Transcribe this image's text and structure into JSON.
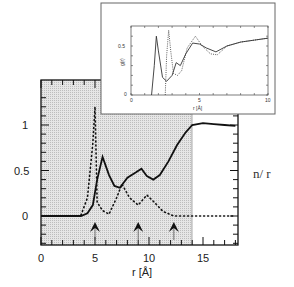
{
  "chart_data": [
    {
      "type": "line",
      "title": "",
      "xlabel": "r [Å]",
      "ylabel": "",
      "xlim": [
        0,
        18
      ],
      "ylim": [
        -0.35,
        1.3
      ],
      "xticks": [
        "0",
        "5",
        "10",
        "15"
      ],
      "yticks": [
        "0",
        "0.5",
        "1"
      ],
      "shaded_region": [
        0,
        14
      ],
      "arrows_at_x": [
        5,
        9,
        12.3
      ],
      "series": [
        {
          "name": "solid",
          "style": "solid",
          "x": [
            0,
            3.7,
            4.3,
            4.8,
            5.2,
            5.7,
            6.3,
            6.8,
            7.3,
            8,
            8.8,
            9.3,
            9.8,
            10.4,
            11,
            11.8,
            12.6,
            13.4,
            14,
            15,
            16,
            17,
            18
          ],
          "y": [
            0,
            0,
            0.03,
            0.12,
            0.4,
            0.65,
            0.45,
            0.33,
            0.31,
            0.42,
            0.48,
            0.52,
            0.44,
            0.4,
            0.45,
            0.6,
            0.78,
            0.92,
            1.0,
            1.02,
            1.01,
            1.0,
            0.99
          ]
        },
        {
          "name": "dotted",
          "style": "dotted",
          "x": [
            3.7,
            4.3,
            4.8,
            5.0,
            5.2,
            5.7,
            6.3,
            7.0,
            7.5,
            8.2,
            9.0,
            9.8,
            10.5,
            11.3,
            12.3,
            14,
            16,
            18
          ],
          "y": [
            0.01,
            0.2,
            0.8,
            1.2,
            0.15,
            0.06,
            0.02,
            0.2,
            0.35,
            0.2,
            0.12,
            0.23,
            0.15,
            0.05,
            0.0,
            0.0,
            0.0,
            0.0
          ]
        }
      ]
    },
    {
      "type": "line",
      "title": "inset",
      "xlabel": "r [Å]",
      "ylabel": "g(r)",
      "xlim": [
        0,
        10
      ],
      "ylim": [
        0,
        0.7
      ],
      "xticks": [
        "0",
        "5",
        "10"
      ],
      "yticks": [
        "0",
        "0.5"
      ],
      "series": [
        {
          "name": "solid",
          "style": "solid",
          "x": [
            1.5,
            1.7,
            1.85,
            2.0,
            2.3,
            2.6,
            3.0,
            3.3,
            3.6,
            4.0,
            4.5,
            5.0,
            5.5,
            6.2,
            7.0,
            8.0,
            9.0,
            10.0
          ],
          "y": [
            0,
            0.3,
            0.6,
            0.45,
            0.18,
            0.14,
            0.2,
            0.33,
            0.3,
            0.42,
            0.53,
            0.52,
            0.48,
            0.44,
            0.5,
            0.54,
            0.56,
            0.58
          ]
        },
        {
          "name": "dotted",
          "style": "dotted",
          "x": [
            2.5,
            2.6,
            2.75,
            2.9,
            3.1,
            3.4,
            3.7,
            4.1,
            4.7,
            5.2,
            5.8,
            6.3,
            7.0,
            8.0,
            9.0,
            10.0
          ],
          "y": [
            0,
            0.4,
            0.66,
            0.45,
            0.22,
            0.2,
            0.25,
            0.48,
            0.6,
            0.5,
            0.42,
            0.41,
            0.5,
            0.54,
            0.56,
            0.58
          ]
        }
      ]
    }
  ],
  "labels": {
    "main_xlabel": "r [Å]",
    "main_ytick_0": "0",
    "main_ytick_05": "0.5",
    "main_ytick_1": "1",
    "main_xtick_0": "0",
    "main_xtick_5": "5",
    "main_xtick_10": "10",
    "main_xtick_15": "15",
    "inset_xlabel": "r [Å]",
    "inset_ylabel": "g(r)",
    "inset_ytick_0": "0",
    "inset_ytick_05": "0.5",
    "inset_xtick_0": "0",
    "inset_xtick_5": "5",
    "inset_xtick_10": "10",
    "side_label": "n/ r"
  }
}
